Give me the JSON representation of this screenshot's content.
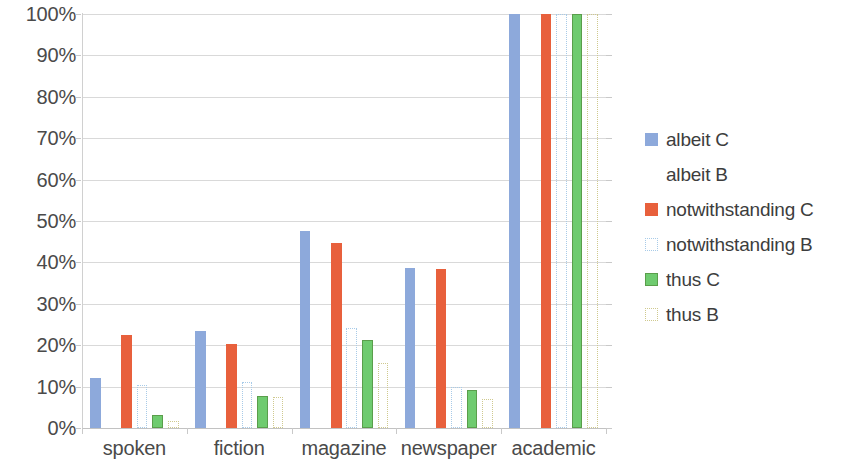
{
  "chart_data": {
    "type": "bar",
    "title": "",
    "subtitle": "",
    "xlabel": "",
    "ylabel": "",
    "ylim": [
      0,
      100
    ],
    "ytick_labels": [
      "100%",
      "90%",
      "80%",
      "70%",
      "60%",
      "50%",
      "40%",
      "30%",
      "20%",
      "10%",
      "0%"
    ],
    "ytick_values": [
      100,
      90,
      80,
      70,
      60,
      50,
      40,
      30,
      20,
      10,
      0
    ],
    "grid": true,
    "legend_position": "right",
    "categories": [
      "spoken",
      "fiction",
      "magazine",
      "newspaper",
      "academic"
    ],
    "series": [
      {
        "name": "albeit C",
        "style": "solid",
        "fill": "#8DA9DB",
        "stroke": "#8DA9DB",
        "values": [
          12.0,
          23.4,
          47.6,
          38.7,
          100.0
        ]
      },
      {
        "name": "albeit B",
        "style": "none",
        "fill": "#ffffff",
        "stroke": "#ffffff",
        "values": [
          0.0,
          0.0,
          0.0,
          0.0,
          0.0
        ]
      },
      {
        "name": "notwithstanding C",
        "style": "solid",
        "fill": "#E8603C",
        "stroke": "#E8603C",
        "values": [
          22.4,
          20.4,
          44.7,
          38.4,
          100.0
        ]
      },
      {
        "name": "notwithstanding B",
        "style": "outline",
        "fill": "#ffffff",
        "stroke": "#A8CBE8",
        "values": [
          10.3,
          11.0,
          24.1,
          9.8,
          100.0
        ]
      },
      {
        "name": "thus C",
        "style": "solid",
        "fill": "#6FCB6F",
        "stroke": "#5A9E4B",
        "values": [
          3.1,
          7.8,
          21.3,
          9.2,
          100.0
        ]
      },
      {
        "name": "thus B",
        "style": "outline",
        "fill": "#ffffff",
        "stroke": "#CFC98E",
        "values": [
          1.7,
          7.4,
          15.6,
          7.0,
          100.0
        ]
      }
    ],
    "colors": {
      "blue": "#8DA9DB",
      "orange": "#E8603C",
      "green": "#6FCB6F",
      "light_blue_outline": "#A8CBE8",
      "tan_outline": "#CFC98E",
      "gridline": "#D9D9D9",
      "axis": "#C2C2C2",
      "text": "#3D3D3D"
    }
  },
  "legend": {
    "items": [
      {
        "label": "albeit C",
        "swatch": "solid",
        "color": "#8DA9DB",
        "border": "#8DA9DB"
      },
      {
        "label": "albeit B",
        "swatch": "none",
        "color": "#FFFFFF",
        "border": "#FFFFFF"
      },
      {
        "label": "notwithstanding C",
        "swatch": "solid",
        "color": "#E8603C",
        "border": "#E8603C"
      },
      {
        "label": "notwithstanding B",
        "swatch": "outline",
        "color": "#FFFFFF",
        "border": "#A8CBE8"
      },
      {
        "label": "thus C",
        "swatch": "solid",
        "color": "#6FCB6F",
        "border": "#5A9E4B"
      },
      {
        "label": "thus B",
        "swatch": "outline",
        "color": "#FFFFFF",
        "border": "#CFC98E"
      }
    ]
  }
}
